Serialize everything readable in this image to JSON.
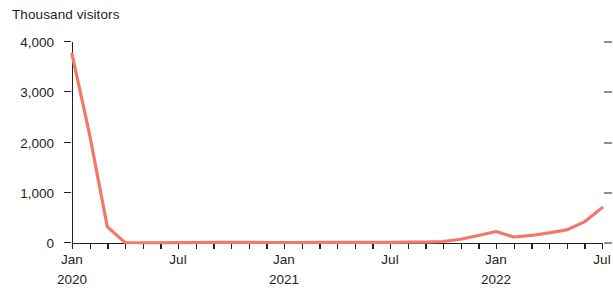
{
  "chart_data": {
    "type": "line",
    "title": "",
    "ylabel": "Thousand visitors",
    "xlabel": "",
    "ylim": [
      0,
      4000
    ],
    "grid": false,
    "legend": "none",
    "line_color": "#f4776a",
    "y_ticks": [
      {
        "value": 4000,
        "label": "4,000"
      },
      {
        "value": 3000,
        "label": "3,000"
      },
      {
        "value": 2000,
        "label": "2,000"
      },
      {
        "value": 1000,
        "label": "1,000"
      },
      {
        "value": 0,
        "label": "0"
      }
    ],
    "x_axis_labels": [
      {
        "label": "Jan",
        "index": 0
      },
      {
        "label": "Jul",
        "index": 6
      },
      {
        "label": "Jan",
        "index": 12
      },
      {
        "label": "Jul",
        "index": 18
      },
      {
        "label": "Jan",
        "index": 24
      },
      {
        "label": "Jul",
        "index": 30
      }
    ],
    "x_year_labels": [
      {
        "label": "2020",
        "index": 0
      },
      {
        "label": "2021",
        "index": 12
      },
      {
        "label": "2022",
        "index": 24
      }
    ],
    "x": [
      "Jan 2020",
      "Feb 2020",
      "Mar 2020",
      "Apr 2020",
      "May 2020",
      "Jun 2020",
      "Jul 2020",
      "Aug 2020",
      "Sep 2020",
      "Oct 2020",
      "Nov 2020",
      "Dec 2020",
      "Jan 2021",
      "Feb 2021",
      "Mar 2021",
      "Apr 2021",
      "May 2021",
      "Jun 2021",
      "Jul 2021",
      "Aug 2021",
      "Sep 2021",
      "Oct 2021",
      "Nov 2021",
      "Dec 2021",
      "Jan 2022",
      "Feb 2022",
      "Mar 2022",
      "Apr 2022",
      "May 2022",
      "Jun 2022",
      "Jul 2022"
    ],
    "values": [
      3760,
      2150,
      320,
      10,
      5,
      5,
      8,
      10,
      12,
      14,
      12,
      10,
      10,
      10,
      12,
      14,
      14,
      12,
      14,
      16,
      18,
      30,
      75,
      150,
      230,
      120,
      150,
      200,
      260,
      420,
      700
    ]
  }
}
